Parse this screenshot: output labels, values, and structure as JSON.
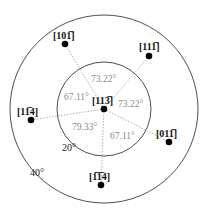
{
  "diagram": {
    "type": "stereographic-projection",
    "center": {
      "label": "[113̅]",
      "x": 104,
      "y": 109
    },
    "circles": [
      {
        "label": "20°",
        "r": 47,
        "label_x": 62,
        "label_y": 151
      },
      {
        "label": "40°",
        "r": 94,
        "label_x": 30,
        "label_y": 176
      }
    ],
    "poles": [
      {
        "label": "[101̅]",
        "x": 65,
        "y": 44,
        "label_x": 53,
        "label_y": 39
      },
      {
        "label": "[111̅]",
        "x": 149,
        "y": 56,
        "label_x": 139,
        "label_y": 50
      },
      {
        "label": "[11̅4]",
        "x": 31,
        "y": 120,
        "label_x": 17,
        "label_y": 115
      },
      {
        "label": "[011̅]",
        "x": 169,
        "y": 142,
        "label_x": 156,
        "label_y": 137
      },
      {
        "label": "[1̅1̅4]",
        "x": 101,
        "y": 185,
        "label_x": 89,
        "label_y": 180
      }
    ],
    "angles": [
      {
        "label": "73.22°",
        "x": 91,
        "y": 82
      },
      {
        "label": "67.11°",
        "x": 64,
        "y": 100
      },
      {
        "label": "73.22°",
        "x": 118,
        "y": 107
      },
      {
        "label": "79.33°",
        "x": 72,
        "y": 130
      },
      {
        "label": "67.11°",
        "x": 110,
        "y": 139
      }
    ],
    "colors": {
      "circle": "#222222",
      "spoke": "#9a9a9a",
      "pole": "#000000",
      "angle_text": "#8a8a8a"
    }
  }
}
